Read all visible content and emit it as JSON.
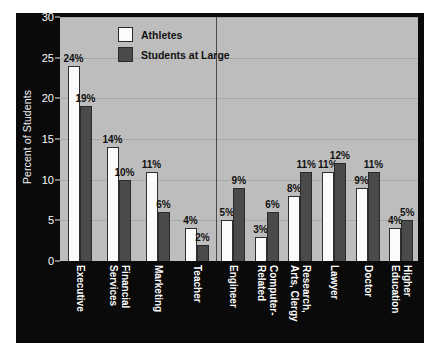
{
  "chart_data": {
    "type": "bar",
    "title": "",
    "xlabel": "",
    "ylabel": "Percent of Students",
    "ylim": [
      0,
      30
    ],
    "yticks": [
      0,
      5,
      10,
      15,
      20,
      25,
      30
    ],
    "grid": true,
    "legend_position": "top-center",
    "value_suffix": "%",
    "categories": [
      "Executive",
      "Financial Services",
      "Marketing",
      "Teacher",
      "Engineer",
      "Computer-Related",
      "Arts, Clergy",
      "Research,",
      "Lawyer",
      "Doctor",
      "Higher Education"
    ],
    "series": [
      {
        "name": "Athletes",
        "color": "#fbfbfb",
        "values": [
          24,
          14,
          11,
          4,
          5,
          3,
          8,
          11,
          11,
          9,
          4
        ]
      },
      {
        "name": "Students at Large",
        "color": "#4a4a4a",
        "values": [
          19,
          10,
          6,
          2,
          9,
          6,
          11,
          null,
          12,
          11,
          5
        ]
      }
    ],
    "groups": [
      {
        "label_lines": [
          "Executive"
        ],
        "athletes": 24,
        "athletes_label": "24%",
        "students": 19,
        "students_label": "19%"
      },
      {
        "label_lines": [
          "Financial",
          "Services"
        ],
        "athletes": 14,
        "athletes_label": "14%",
        "students": 10,
        "students_label": "10%"
      },
      {
        "label_lines": [
          "Marketing"
        ],
        "athletes": 11,
        "athletes_label": "11%",
        "students": 6,
        "students_label": "6%"
      },
      {
        "label_lines": [
          "Teacher"
        ],
        "athletes": 4,
        "athletes_label": "4%",
        "students": 2,
        "students_label": "2%"
      },
      {
        "label_lines": [
          "Engineer"
        ],
        "athletes": 5,
        "athletes_label": "5%",
        "students": 9,
        "students_label": "9%"
      },
      {
        "label_lines": [
          "Computer-",
          "Related"
        ],
        "athletes": 3,
        "athletes_label": "3%",
        "students": 6,
        "students_label": "6%"
      },
      {
        "label_lines": [
          "Research,",
          "Arts, Clergy"
        ],
        "athletes": 8,
        "athletes_label": "8%",
        "students": 11,
        "students_label": "11%"
      },
      {
        "label_lines": [
          "Lawyer"
        ],
        "athletes": 11,
        "athletes_label": "11%",
        "students": 12,
        "students_label": "12%"
      },
      {
        "label_lines": [
          "Doctor"
        ],
        "athletes": 9,
        "athletes_label": "9%",
        "students": 11,
        "students_label": "11%"
      },
      {
        "label_lines": [
          "Higher",
          "Education"
        ],
        "athletes": 4,
        "athletes_label": "4%",
        "students": 5,
        "students_label": "5%"
      }
    ]
  },
  "legend": {
    "items": [
      {
        "label": "Athletes",
        "color": "#fbfbfb"
      },
      {
        "label": "Students at Large",
        "color": "#4a4a4a"
      }
    ]
  },
  "axis": {
    "y_title": "Percent of Students",
    "y_ticks": [
      "30",
      "25",
      "20",
      "15",
      "10",
      "5",
      "0"
    ]
  },
  "colors": {
    "figure_background": "#0a0a0a",
    "plot_background": "#bdbdbd",
    "gridline": "#a8a8a8",
    "divider": "#4b4b4b",
    "athletes_bar": "#fbfbfb",
    "students_bar": "#4a4a4a",
    "tick_text": "#fdfdfd",
    "value_text": "#111111"
  }
}
